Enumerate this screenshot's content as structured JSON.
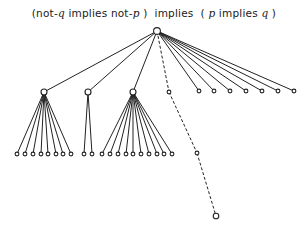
{
  "title": {
    "prefix": "(not-",
    "q1": "q",
    "mid1": " implies not-",
    "p1": "p",
    "mid2": " )  implies  ( ",
    "p2": "p",
    "mid3": " implies ",
    "q2": "q",
    "suffix": " )"
  },
  "tree": {
    "root": {
      "x": 157,
      "y": 31
    },
    "hubs": [
      {
        "x": 44,
        "y": 92,
        "leaves": [
          17,
          25,
          33,
          41,
          48,
          56,
          63,
          71
        ]
      },
      {
        "x": 88,
        "y": 92,
        "leaves": [
          84,
          92
        ]
      },
      {
        "x": 133,
        "y": 92,
        "leaves": [
          102,
          110,
          118,
          126,
          133,
          141,
          149,
          157,
          164,
          172
        ]
      }
    ],
    "dashed_path": [
      {
        "x": 169,
        "y": 92
      },
      {
        "x": 197,
        "y": 153
      },
      {
        "x": 216,
        "y": 216
      }
    ],
    "right_leaves": [
      199,
      214,
      230,
      246,
      262,
      278,
      294
    ],
    "leaf_y": 154,
    "right_leaf_y": 91
  }
}
